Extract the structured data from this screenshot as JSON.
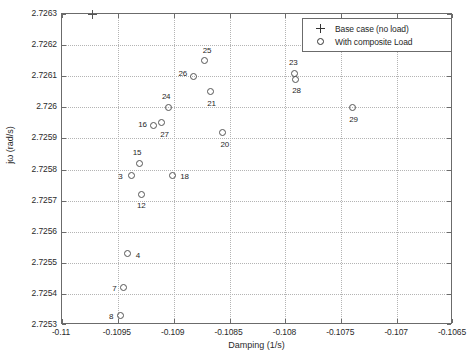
{
  "chart_data": {
    "type": "scatter",
    "title": "",
    "xlabel": "Damping (1/s)",
    "ylabel": "jω (rad/s)",
    "xlim": [
      -0.11,
      -0.1065
    ],
    "ylim": [
      2.7253,
      2.7263
    ],
    "xticks": [
      -0.11,
      -0.1095,
      -0.109,
      -0.1085,
      -0.108,
      -0.1075,
      -0.107,
      -0.1065
    ],
    "xticklabels": [
      "-0.11",
      "-0.1095",
      "-0.109",
      "-0.1085",
      "-0.108",
      "-0.1075",
      "-0.107",
      "-0.1065"
    ],
    "yticks": [
      2.7253,
      2.7254,
      2.7255,
      2.7256,
      2.7257,
      2.7258,
      2.7259,
      2.726,
      2.7261,
      2.7262,
      2.7263
    ],
    "yticklabels": [
      "2.7253",
      "2.7254",
      "2.7255",
      "2.7256",
      "2.7257",
      "2.7258",
      "2.7259",
      "2.726",
      "2.7261",
      "2.7262",
      "2.7263"
    ],
    "grid": true,
    "legend_position": "top-right",
    "marker_color": "#555555",
    "grid_color": "#b4b4b4",
    "axis_color": "#6b6b6b",
    "series": [
      {
        "name": "Base case (no load)",
        "marker": "plus",
        "points": [
          {
            "label": "",
            "x": -0.10973,
            "y": 2.7263
          }
        ]
      },
      {
        "name": "With composite Load",
        "marker": "circle",
        "points": [
          {
            "label": "3",
            "x": -0.10938,
            "y": 2.72578,
            "label_dx": -11,
            "label_dy": 0
          },
          {
            "label": "4",
            "x": -0.10941,
            "y": 2.72553,
            "label_dx": 10,
            "label_dy": 2
          },
          {
            "label": "7",
            "x": -0.10945,
            "y": 2.72542,
            "label_dx": -9,
            "label_dy": 0
          },
          {
            "label": "8",
            "x": -0.10948,
            "y": 2.72533,
            "label_dx": -9,
            "label_dy": 0
          },
          {
            "label": "12",
            "x": -0.10929,
            "y": 2.72572,
            "label_dx": 0,
            "label_dy": 11
          },
          {
            "label": "15",
            "x": -0.10931,
            "y": 2.72582,
            "label_dx": -2,
            "label_dy": -11
          },
          {
            "label": "16",
            "x": -0.10918,
            "y": 2.72594,
            "label_dx": -11,
            "label_dy": -2
          },
          {
            "label": "18",
            "x": -0.10901,
            "y": 2.72578,
            "label_dx": 12,
            "label_dy": 0
          },
          {
            "label": "20",
            "x": -0.10856,
            "y": 2.72592,
            "label_dx": 2,
            "label_dy": 12
          },
          {
            "label": "21",
            "x": -0.10867,
            "y": 2.72605,
            "label_dx": 1,
            "label_dy": 11
          },
          {
            "label": "23",
            "x": -0.10792,
            "y": 2.72611,
            "label_dx": -1,
            "label_dy": -11
          },
          {
            "label": "24",
            "x": -0.10905,
            "y": 2.726,
            "label_dx": -2,
            "label_dy": -11
          },
          {
            "label": "25",
            "x": -0.10872,
            "y": 2.72615,
            "label_dx": 2,
            "label_dy": -11
          },
          {
            "label": "26",
            "x": -0.10882,
            "y": 2.7261,
            "label_dx": -11,
            "label_dy": -3
          },
          {
            "label": "27",
            "x": -0.10911,
            "y": 2.72595,
            "label_dx": 3,
            "label_dy": 11
          },
          {
            "label": "28",
            "x": -0.10791,
            "y": 2.72609,
            "label_dx": 1,
            "label_dy": 11
          },
          {
            "label": "29",
            "x": -0.1074,
            "y": 2.726,
            "label_dx": 1,
            "label_dy": 12
          }
        ]
      }
    ]
  },
  "legend": {
    "entries": [
      {
        "label": "Base case (no load)",
        "marker": "plus"
      },
      {
        "label": "With composite Load",
        "marker": "circle"
      }
    ]
  }
}
